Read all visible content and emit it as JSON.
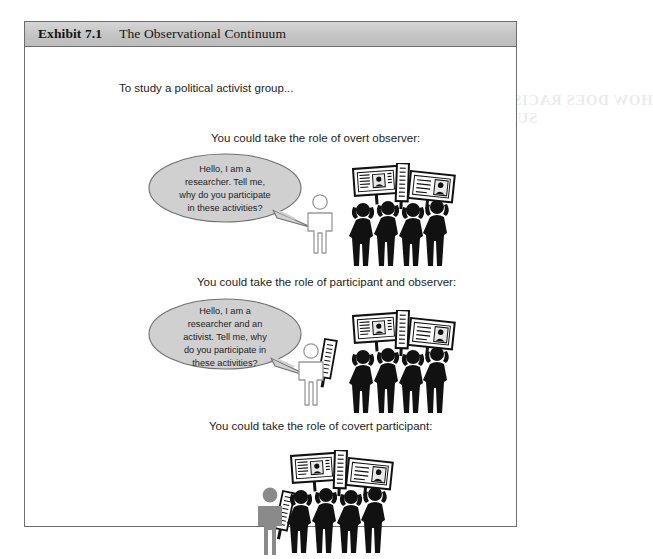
{
  "exhibit": {
    "label": "Exhibit 7.1",
    "title": "The Observational Continuum"
  },
  "intro": "To study a political activist group...",
  "scenes": [
    {
      "heading": "You could take the role of overt observer:",
      "bubble_lines": [
        "Hello, I am a",
        "researcher. Tell me,",
        "why do you participate",
        "in these activities?"
      ],
      "researcher_role": "overt-observer",
      "researcher_style": "outline",
      "researcher_holds_sign": false,
      "protester_count": 4
    },
    {
      "heading": "You could take the role of participant and observer:",
      "bubble_lines": [
        "Hello, I am a",
        "researcher and an",
        "activist. Tell me, why",
        "do you participate in",
        "these activities?"
      ],
      "researcher_role": "participant-observer",
      "researcher_style": "outline",
      "researcher_holds_sign": true,
      "protester_count": 4
    },
    {
      "heading": "You could take the role of covert participant:",
      "bubble_lines": [],
      "researcher_role": "covert-participant",
      "researcher_style": "gray",
      "researcher_holds_sign": true,
      "protester_count": 4
    }
  ],
  "ghost_text": {
    "line1": "HOW DOES RACISM AFFECT YOUR",
    "line2": "SUBCULTURE RISE?"
  },
  "colors": {
    "header_band": "#c4c4c4",
    "frame_border": "#6d6d6d",
    "bubble_fill": "#d0d0d0",
    "bubble_stroke": "#6f6f6f",
    "protester_fill": "#111111",
    "covert_figure_fill": "#8a8a8a",
    "outline_figure_stroke": "#9a9a9a",
    "text": "#1d1d1d",
    "page_background": "#ffffff"
  }
}
